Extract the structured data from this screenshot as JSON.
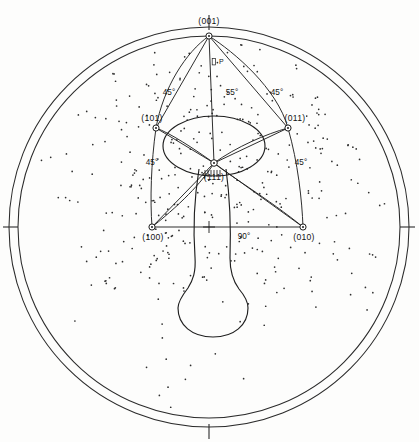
{
  "figure": {
    "type": "stereographic-projection",
    "title": "",
    "background_color": "#fdfdfc",
    "line_color": "#232323"
  },
  "chart_data": {
    "type": "scatter",
    "title": "",
    "subtitle": "",
    "xlabel": "",
    "ylabel": "",
    "grid": false,
    "legend_position": "none",
    "projection_center": {
      "x": 209,
      "y": 227
    },
    "outer_radius": 200,
    "inner_radius": 191,
    "poles": [
      {
        "label": "(001)",
        "x": 209,
        "y": 36,
        "label_x": 209,
        "label_y": 22,
        "marker": "ring"
      },
      {
        "label": "(101)",
        "x": 156,
        "y": 128,
        "label_x": 150,
        "label_y": 118,
        "marker": "ring"
      },
      {
        "label": "(011)",
        "x": 288,
        "y": 128,
        "label_x": 296,
        "label_y": 118,
        "marker": "ring"
      },
      {
        "label": "(111)",
        "x": 214,
        "y": 163,
        "label_x": 214,
        "label_y": 178,
        "marker": "ring"
      },
      {
        "label": "(100)",
        "x": 152,
        "y": 227,
        "label_x": 152,
        "label_y": 239,
        "marker": "ring"
      },
      {
        "label": "(010)",
        "x": 303,
        "y": 227,
        "label_x": 303,
        "label_y": 239,
        "marker": "ring"
      }
    ],
    "angle_annotations": [
      {
        "label": "45°",
        "x": 169,
        "y": 92
      },
      {
        "label": "55°",
        "x": 231,
        "y": 92
      },
      {
        "label": "45°",
        "x": 276,
        "y": 92
      },
      {
        "label": "45°",
        "x": 152,
        "y": 162
      },
      {
        "label": "45°",
        "x": 300,
        "y": 162
      },
      {
        "label": "90°",
        "x": 243,
        "y": 236
      }
    ],
    "point_markers": [
      {
        "label": "P",
        "x": 215,
        "y": 62
      }
    ],
    "axis_ticks": [
      {
        "position": "left",
        "x": 10,
        "y": 227
      },
      {
        "position": "right",
        "x": 409,
        "y": 227
      },
      {
        "position": "bottom",
        "x": 209,
        "y": 432
      },
      {
        "position": "top",
        "x": 209,
        "y": 27
      }
    ],
    "scatter_point_count": 430,
    "scatter_point_radius": 0.85
  },
  "labels": {
    "pole_001": "(001)",
    "pole_101": "(101)",
    "pole_011": "(011)",
    "pole_111": "(111)",
    "pole_100": "(100)",
    "pole_010": "(010)",
    "angle_45_upper_left": "45°",
    "angle_55_center": "55°",
    "angle_45_upper_right": "45°",
    "angle_45_lower_left": "45°",
    "angle_45_lower_right": "45°",
    "angle_90_equator": "90°",
    "marker_p": "P"
  }
}
